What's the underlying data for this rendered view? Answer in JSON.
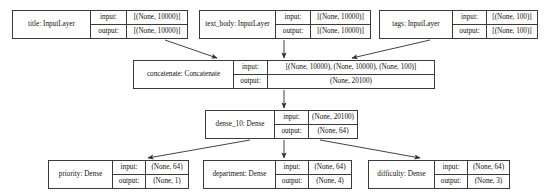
{
  "diagram": {
    "type": "keras-model-plot",
    "io_labels": {
      "input": "input:",
      "output": "output:"
    },
    "nodes": [
      {
        "id": "title",
        "name": "title: InputLayer",
        "input": "[(None, 10000)]",
        "output": "[(None, 10000)]",
        "x": 12,
        "y": 10,
        "w": 176,
        "h": 29,
        "name_w": 78,
        "label_w": 36
      },
      {
        "id": "text_body",
        "name": "text_body: InputLayer",
        "input": "[(None, 10000)]",
        "output": "[(None, 10000)]",
        "x": 199,
        "y": 10,
        "w": 172,
        "h": 29,
        "name_w": 76,
        "label_w": 35
      },
      {
        "id": "tags",
        "name": "tags: InputLayer",
        "input": "[(None, 100)]",
        "output": "[(None, 100)]",
        "x": 379,
        "y": 10,
        "w": 159,
        "h": 29,
        "name_w": 73,
        "label_w": 34
      },
      {
        "id": "concatenate",
        "name": "concatenate: Concatenate",
        "input": "[(None, 10000), (None, 10000), (None, 100)]",
        "output": "(None, 20100)",
        "x": 133,
        "y": 60,
        "w": 302,
        "h": 29,
        "name_w": 100,
        "label_w": 34
      },
      {
        "id": "dense_10",
        "name": "dense_10: Dense",
        "input": "(None, 20100)",
        "output": "(None, 64)",
        "x": 205,
        "y": 110,
        "w": 153,
        "h": 29,
        "name_w": 70,
        "label_w": 34
      },
      {
        "id": "priority",
        "name": "priority: Dense",
        "input": "(None, 64)",
        "output": "(None, 1)",
        "x": 48,
        "y": 160,
        "w": 141,
        "h": 29,
        "name_w": 64,
        "label_w": 33
      },
      {
        "id": "department",
        "name": "department: Dense",
        "input": "(None, 64)",
        "output": "(None, 4)",
        "x": 203,
        "y": 160,
        "w": 149,
        "h": 29,
        "name_w": 72,
        "label_w": 33
      },
      {
        "id": "difficulty",
        "name": "difficulty: Dense",
        "input": "(None, 64)",
        "output": "(None, 3)",
        "x": 368,
        "y": 160,
        "w": 142,
        "h": 29,
        "name_w": 66,
        "label_w": 33
      }
    ],
    "edges": [
      {
        "from": "title",
        "to": "concatenate",
        "x1": 165,
        "y1": 40,
        "x2": 217,
        "y2": 58
      },
      {
        "from": "text_body",
        "to": "concatenate",
        "x1": 284,
        "y1": 40,
        "x2": 284,
        "y2": 58
      },
      {
        "from": "tags",
        "to": "concatenate",
        "x1": 430,
        "y1": 40,
        "x2": 352,
        "y2": 58
      },
      {
        "from": "concatenate",
        "to": "dense_10",
        "x1": 284,
        "y1": 90,
        "x2": 284,
        "y2": 108
      },
      {
        "from": "dense_10",
        "to": "priority",
        "x1": 250,
        "y1": 140,
        "x2": 148,
        "y2": 158
      },
      {
        "from": "dense_10",
        "to": "department",
        "x1": 284,
        "y1": 140,
        "x2": 284,
        "y2": 158
      },
      {
        "from": "dense_10",
        "to": "difficulty",
        "x1": 320,
        "y1": 140,
        "x2": 420,
        "y2": 158
      }
    ]
  }
}
